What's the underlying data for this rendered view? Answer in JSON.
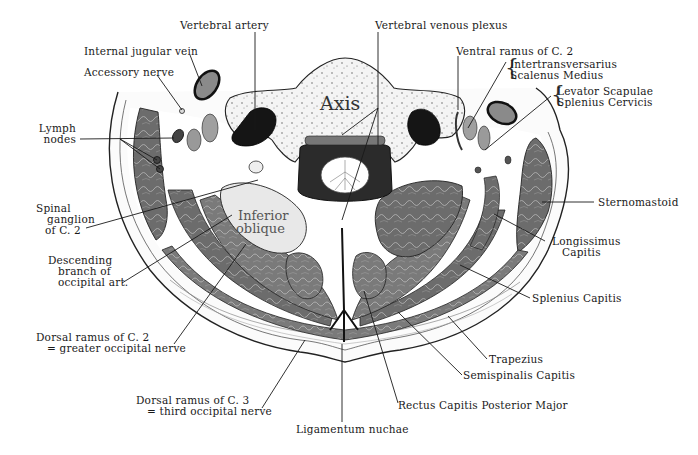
{
  "figure": {
    "inner_labels": {
      "axis": "Axis",
      "inferior_oblique_1": "Inferior",
      "inferior_oblique_2": "oblique"
    },
    "labels": {
      "vertebral_artery": "Vertebral artery",
      "vertebral_venous_plexus": "Vertebral venous plexus",
      "internal_jugular_vein": "Internal jugular vein",
      "accessory_nerve": "Accessory nerve",
      "ventral_ramus_c2": "Ventral ramus of  C. 2",
      "intertransversarius": "Intertransversarius",
      "scalenus_medius": "Scalenus Medius",
      "levator_scapulae": "Levator Scapulae",
      "splenius_cervicis": "Splenius Cervicis",
      "lymph_nodes_1": "Lymph",
      "lymph_nodes_2": "nodes",
      "spinal_ganglion_1": "Spinal",
      "spinal_ganglion_2": "ganglion",
      "spinal_ganglion_3": "of C. 2",
      "sternomastoid": "Sternomastoid",
      "descending_branch_1": "Descending",
      "descending_branch_2": "branch of",
      "descending_branch_3": "occipital art.",
      "longissimus_1": "Longissimus",
      "longissimus_2": "Capitis",
      "splenius_capitis": "Splenius Capitis",
      "dorsal_ramus_c2_1": "Dorsal ramus of C. 2",
      "dorsal_ramus_c2_2": "= greater occipital nerve",
      "trapezius": "Trapezius",
      "semispinalis_capitis": "Semispinalis Capitis",
      "dorsal_ramus_c3_1": "Dorsal ramus of C. 3",
      "dorsal_ramus_c3_2": "= third occipital nerve",
      "rectus_capitis": "Rectus Capitis Posterior Major",
      "ligamentum_nuchae": "Ligamentum nuchae"
    },
    "colors": {
      "muscle": "#6f6f6f",
      "muscle_light": "#9a9a9a",
      "bone": "#f2f2f2",
      "vessel_dark": "#1a1a1a",
      "skin": "#fafafa",
      "line": "#1a1a1a"
    }
  }
}
